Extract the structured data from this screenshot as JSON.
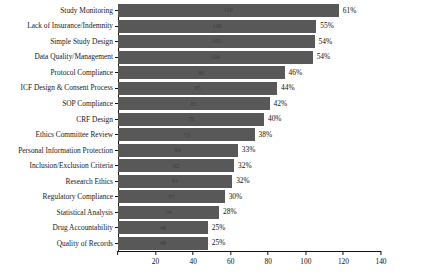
{
  "chart_data": {
    "type": "bar",
    "orientation": "horizontal",
    "title": "",
    "subtitle": "",
    "xlabel": "",
    "ylabel": "",
    "xlim": [
      0,
      140
    ],
    "xticks": [
      0,
      20,
      40,
      60,
      80,
      100,
      120,
      140
    ],
    "grid": false,
    "legend": false,
    "bar_color": "#585858",
    "axis_color": "#111111",
    "categories": [
      "Study Monitoring",
      "Lack of Insurance/Indemnity",
      "Simple Study Design",
      "Data Quality/Management",
      "Protocol Compliance",
      "ICF Design & Consent Process",
      "SOP Compliance",
      "CRF Design",
      "Ethics Committee Review",
      "Personal Information Protection",
      "Inclusion/Exclusion Criteria",
      "Research Ethics",
      "Regulatory Compliance",
      "Statistical Analysis",
      "Drug Accountability",
      "Quality of Records"
    ],
    "values": [
      118,
      106,
      105,
      104,
      89,
      85,
      81,
      78,
      73,
      64,
      62,
      61,
      57,
      54,
      48,
      48
    ],
    "percent_labels": [
      "61%",
      "55%",
      "54%",
      "54%",
      "46%",
      "44%",
      "42%",
      "40%",
      "38%",
      "33%",
      "32%",
      "32%",
      "30%",
      "28%",
      "25%",
      "25%"
    ],
    "value_labels": [
      "118",
      "106",
      "105",
      "104",
      "89",
      "85",
      "81",
      "78",
      "73",
      "64",
      "62",
      "61",
      "57",
      "54",
      "48",
      "48"
    ],
    "xtick_labels": [
      "0",
      "20",
      "40",
      "60",
      "80",
      "100",
      "120",
      "140"
    ]
  }
}
